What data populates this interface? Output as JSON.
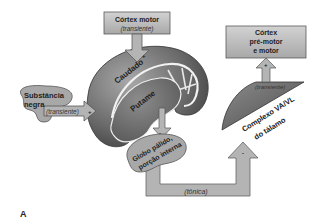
{
  "diagram": {
    "panel_label": "A",
    "nodes": {
      "motor_cortex": {
        "title": "Córtex motor",
        "subtitle": "(transiente)"
      },
      "premotor_cortex": {
        "line1": "Córtex",
        "line2": "pré-motor",
        "line3": "e motor"
      },
      "substantia_nigra": {
        "line1": "Substância",
        "line2": "negra",
        "arrow_label": "(transiente)"
      },
      "caudate": {
        "label": "Caudado"
      },
      "putamen": {
        "label": "Putame"
      },
      "globus_pallidus": {
        "line1": "Globo pálido,",
        "line2": "porção interna"
      },
      "thalamus": {
        "line1": "Complexo VA/VL",
        "line2": "do tálamo",
        "arrow_label": "(transiente)"
      }
    },
    "connections": [
      {
        "from": "motor_cortex",
        "to": "caudate",
        "sign": "+"
      },
      {
        "from": "substantia_nigra",
        "to": "caudate",
        "sign": "+"
      },
      {
        "from": "putamen",
        "to": "globus_pallidus",
        "sign": "-"
      },
      {
        "from": "globus_pallidus",
        "to": "thalamus",
        "sign": "-",
        "label": "(tônica)"
      },
      {
        "from": "thalamus",
        "to": "premotor_cortex",
        "sign": "+"
      }
    ],
    "colors": {
      "box_fill": "#bdbdbd",
      "box_stroke": "#5a5a5a",
      "striatum_dark": "#4a4a4a",
      "striatum_light": "#9a9a9a",
      "thalamus_fill": "#6e6e6e",
      "blob_fill": "#a8a8a8"
    }
  }
}
